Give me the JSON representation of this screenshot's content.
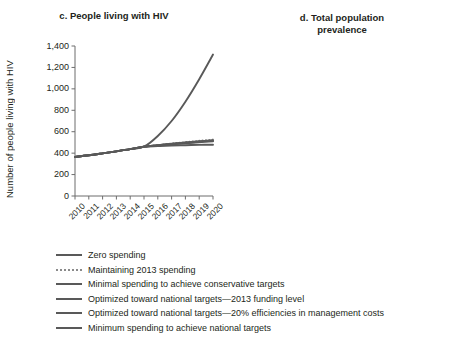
{
  "chart_data": [
    {
      "type": "line",
      "panel": "c",
      "title": "c. People living with HIV",
      "xlabel": "",
      "ylabel": "Number of people living with HIV",
      "x": [
        2010,
        2011,
        2012,
        2013,
        2014,
        2015,
        2016,
        2017,
        2018,
        2019,
        2020
      ],
      "xticklabels": [
        "2010",
        "2011",
        "2012",
        "2013",
        "2014",
        "2015",
        "2016",
        "2017",
        "2018",
        "2019",
        "2020"
      ],
      "yticklabels": [
        "0",
        "200",
        "400",
        "600",
        "800",
        "1,000",
        "1,200",
        "1,400"
      ],
      "ylim": [
        0,
        1400
      ],
      "ytickvalues": [
        0,
        200,
        400,
        600,
        800,
        1000,
        1200,
        1400
      ],
      "grid": false,
      "legend_position": "below",
      "series": [
        {
          "name": "Zero spending",
          "style": "solid",
          "color": "#595959",
          "values": [
            365,
            380,
            398,
            417,
            437,
            460,
            560,
            700,
            880,
            1090,
            1320
          ]
        },
        {
          "name": "Maintaining 2013 spending",
          "style": "dotted",
          "color": "#8a8a8a",
          "values": [
            365,
            380,
            398,
            417,
            437,
            460,
            475,
            490,
            503,
            515,
            527
          ]
        },
        {
          "name": "Minimal spending to achieve conservative targets",
          "style": "solid",
          "color": "#595959",
          "values": [
            365,
            380,
            398,
            417,
            437,
            460,
            472,
            483,
            493,
            502,
            510
          ]
        },
        {
          "name": "Optimized toward national targets—2013 funding level",
          "style": "solid",
          "color": "#595959",
          "values": [
            365,
            380,
            398,
            417,
            437,
            460,
            473,
            486,
            497,
            507,
            516
          ]
        },
        {
          "name": "Optimized toward national targets—20% efficiencies in management costs",
          "style": "solid",
          "color": "#595959",
          "values": [
            365,
            380,
            398,
            417,
            437,
            460,
            474,
            488,
            500,
            511,
            521
          ]
        },
        {
          "name": "Minimum spending to achieve national targets",
          "style": "solid",
          "color": "#595959",
          "values": [
            365,
            380,
            398,
            417,
            437,
            460,
            466,
            471,
            474,
            477,
            479
          ]
        }
      ]
    },
    {
      "type": "line",
      "panel": "d",
      "title": "d. Total population prevalence",
      "title_line1": "d. Total population",
      "title_line2": "prevalence",
      "xlabel": "",
      "ylabel": "Total population prevalence (%)",
      "x": [
        2010,
        2011,
        2012,
        2013,
        2014,
        2015,
        2016,
        2017,
        2018,
        2019,
        2020
      ],
      "xticklabels": [
        "2010",
        "2011",
        "2012",
        "2013",
        "2014",
        "2015",
        "2016",
        "2017",
        "2018",
        "2019",
        "2020"
      ],
      "yticklabels": [
        "0",
        "0.05",
        "0.10",
        "0.15",
        "0.20",
        "0.25",
        "0.30",
        "0.35",
        "0.40",
        "0.45",
        "0.50"
      ],
      "ylim": [
        0,
        0.5
      ],
      "ytickvalues": [
        0,
        0.05,
        0.1,
        0.15,
        0.2,
        0.25,
        0.3,
        0.35,
        0.4,
        0.45,
        0.5
      ],
      "grid": false,
      "legend_position": "below",
      "series": [
        {
          "name": "Zero spending",
          "style": "solid",
          "color": "#595959",
          "values": [
            0.125,
            0.129,
            0.133,
            0.138,
            0.143,
            0.149,
            0.178,
            0.222,
            0.278,
            0.345,
            0.418
          ]
        },
        {
          "name": "Maintaining 2013 spending",
          "style": "dotted",
          "color": "#8a8a8a",
          "values": [
            0.125,
            0.129,
            0.133,
            0.138,
            0.143,
            0.149,
            0.153,
            0.157,
            0.161,
            0.164,
            0.167
          ]
        },
        {
          "name": "Minimal spending to achieve conservative targets",
          "style": "solid",
          "color": "#595959",
          "values": [
            0.125,
            0.129,
            0.133,
            0.138,
            0.143,
            0.149,
            0.152,
            0.155,
            0.157,
            0.159,
            0.161
          ]
        },
        {
          "name": "Optimized toward national targets—2013 funding level",
          "style": "solid",
          "color": "#595959",
          "values": [
            0.125,
            0.129,
            0.133,
            0.138,
            0.143,
            0.149,
            0.152,
            0.156,
            0.159,
            0.161,
            0.163
          ]
        },
        {
          "name": "Optimized toward national targets—20% efficiencies in management costs",
          "style": "solid",
          "color": "#595959",
          "values": [
            0.125,
            0.129,
            0.133,
            0.138,
            0.143,
            0.149,
            0.153,
            0.157,
            0.16,
            0.163,
            0.165
          ]
        },
        {
          "name": "Minimum spending to achieve national targets",
          "style": "solid",
          "color": "#595959",
          "values": [
            0.125,
            0.129,
            0.133,
            0.138,
            0.143,
            0.149,
            0.149,
            0.148,
            0.147,
            0.146,
            0.145
          ]
        }
      ]
    }
  ],
  "legend": {
    "items": [
      {
        "label": "Zero spending",
        "style": "solid"
      },
      {
        "label": "Maintaining 2013 spending",
        "style": "dotted"
      },
      {
        "label": "Minimal spending to achieve conservative targets",
        "style": "solid"
      },
      {
        "label": "Optimized toward national targets—2013 funding level",
        "style": "solid"
      },
      {
        "label": "Optimized toward national targets—20% efficiencies in management costs",
        "style": "solid"
      },
      {
        "label": "Minimum spending to achieve national targets",
        "style": "solid"
      }
    ]
  },
  "colors": {
    "line": "#595959",
    "dotted": "#8a8a8a",
    "axis": "#6d6d6d",
    "text": "#231f20"
  }
}
